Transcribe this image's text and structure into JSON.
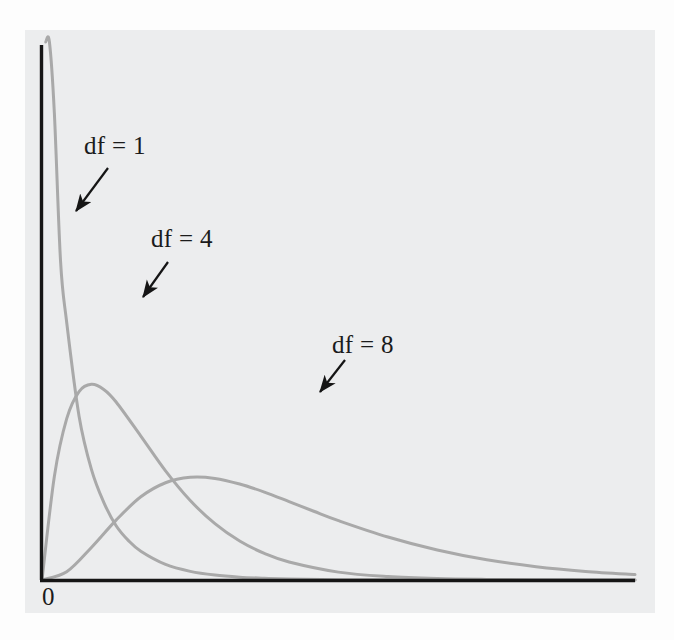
{
  "figure": {
    "background_color": "#fdfdfd",
    "panel_color": "#ecedee",
    "axis_color": "#161616",
    "curve_color": "#a9a9a9",
    "annotation_color": "#1b1b1b",
    "origin_label": "0"
  },
  "labels": {
    "df1": "df = 1",
    "df4": "df = 4",
    "df8": "df = 8"
  },
  "chart_data": {
    "type": "line",
    "title": "",
    "subtitle": "",
    "xlabel": "",
    "ylabel": "",
    "xlim": [
      0,
      24
    ],
    "ylim": [
      0,
      0.5
    ],
    "grid": false,
    "legend_position": "inline-annotations",
    "tick_labels": {
      "x": [
        "0"
      ],
      "y": []
    },
    "annotations": [
      {
        "text": "df = 1",
        "label_x_px": 84,
        "label_y_px": 132,
        "arrow_from_px": [
          108,
          168
        ],
        "arrow_to_px": [
          76,
          211
        ],
        "points_to_series": "df = 1"
      },
      {
        "text": "df = 4",
        "label_x_px": 151,
        "label_y_px": 225,
        "arrow_from_px": [
          168,
          262
        ],
        "arrow_to_px": [
          143,
          297
        ],
        "points_to_series": "df = 4"
      },
      {
        "text": "df = 8",
        "label_x_px": 332,
        "label_y_px": 331,
        "arrow_from_px": [
          345,
          360
        ],
        "arrow_to_px": [
          320,
          392
        ],
        "points_to_series": "df = 8"
      }
    ],
    "series": [
      {
        "name": "df = 1",
        "distribution": "chi-square",
        "degrees_of_freedom": 1,
        "color": "#a9a9a9",
        "mode_x": 0,
        "x": [
          0.15,
          0.3,
          0.5,
          0.75,
          1.0,
          1.5,
          2.0,
          2.5,
          3.0,
          3.5,
          4.0,
          5.0,
          6.0,
          7.0,
          8.0,
          9.0,
          10.0,
          12.0,
          14.0,
          16.0,
          20.0,
          24.0
        ],
        "y": [
          0.8,
          0.628,
          0.439,
          0.3,
          0.242,
          0.154,
          0.104,
          0.073,
          0.051,
          0.037,
          0.027,
          0.0146,
          0.0081,
          0.0046,
          0.0027,
          0.0016,
          0.00085,
          0.00032,
          0.00012,
          5e-05,
          1e-05,
          0.0
        ]
      },
      {
        "name": "df = 4",
        "distribution": "chi-square",
        "degrees_of_freedom": 4,
        "color": "#a9a9a9",
        "mode_x": 2,
        "x": [
          0.0,
          0.5,
          1.0,
          1.5,
          2.0,
          2.5,
          3.0,
          4.0,
          5.0,
          6.0,
          7.0,
          8.0,
          9.0,
          10.0,
          12.0,
          14.0,
          16.0,
          18.0,
          20.0,
          22.0,
          24.0
        ],
        "y": [
          0.0,
          0.0973,
          0.1516,
          0.1771,
          0.1839,
          0.1791,
          0.1673,
          0.1353,
          0.1026,
          0.0747,
          0.0529,
          0.0366,
          0.025,
          0.0169,
          0.0074,
          0.0032,
          0.0013,
          0.00055,
          0.00023,
          9e-05,
          4e-05
        ]
      },
      {
        "name": "df = 8",
        "distribution": "chi-square",
        "degrees_of_freedom": 8,
        "color": "#a9a9a9",
        "mode_x": 6,
        "x": [
          0.0,
          1.0,
          2.0,
          3.0,
          4.0,
          5.0,
          6.0,
          7.0,
          8.0,
          9.0,
          10.0,
          11.0,
          12.0,
          14.0,
          16.0,
          18.0,
          20.0,
          22.0,
          24.0
        ],
        "y": [
          0.0,
          0.0077,
          0.0306,
          0.0563,
          0.0782,
          0.0914,
          0.0965,
          0.0955,
          0.0902,
          0.0826,
          0.0737,
          0.0646,
          0.0558,
          0.0404,
          0.0282,
          0.019,
          0.0125,
          0.0081,
          0.0051
        ]
      }
    ]
  }
}
